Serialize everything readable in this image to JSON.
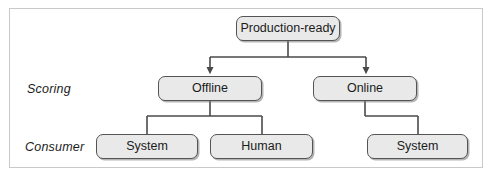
{
  "diagram": {
    "type": "tree",
    "title": "",
    "row_labels": [
      {
        "id": "scoring",
        "text": "Scoring"
      },
      {
        "id": "consumer",
        "text": "Consumer"
      }
    ],
    "nodes": [
      {
        "id": "production-ready",
        "label": "Production-ready",
        "level": 0,
        "x": 236,
        "y": 16,
        "w": 104,
        "h": 25
      },
      {
        "id": "offline",
        "label": "Offline",
        "level": 1,
        "x": 158,
        "y": 76,
        "w": 104,
        "h": 25
      },
      {
        "id": "online",
        "label": "Online",
        "level": 1,
        "x": 313,
        "y": 76,
        "w": 104,
        "h": 25
      },
      {
        "id": "system-offline",
        "label": "System",
        "level": 2,
        "x": 96,
        "y": 134,
        "w": 102,
        "h": 25
      },
      {
        "id": "human-offline",
        "label": "Human",
        "level": 2,
        "x": 210,
        "y": 134,
        "w": 103,
        "h": 25
      },
      {
        "id": "system-online",
        "label": "System",
        "level": 2,
        "x": 367,
        "y": 134,
        "w": 101,
        "h": 25
      }
    ],
    "edges": [
      {
        "from": "production-ready",
        "to": "offline",
        "arrow": true
      },
      {
        "from": "production-ready",
        "to": "online",
        "arrow": true
      },
      {
        "from": "offline",
        "to": "system-offline",
        "arrow": false
      },
      {
        "from": "offline",
        "to": "human-offline",
        "arrow": false
      },
      {
        "from": "online",
        "to": "system-online",
        "arrow": false
      }
    ],
    "colors": {
      "node_fill": "#e9e9e9",
      "node_stroke": "#545454",
      "edge_stroke": "#4a4a4a",
      "frame_stroke": "#c9c9c9",
      "text": "#1b1b1b",
      "background": "#ffffff"
    }
  }
}
